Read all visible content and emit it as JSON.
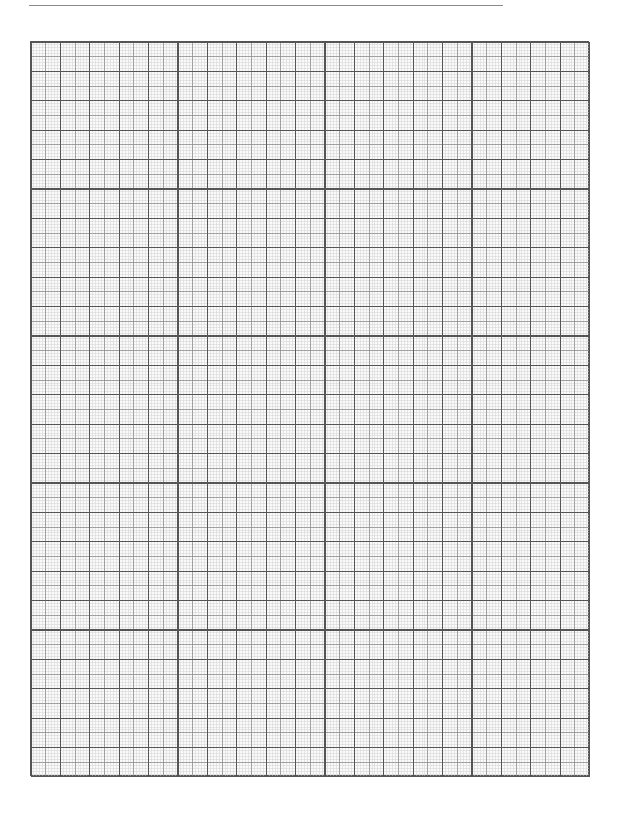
{
  "document": {
    "type": "graph-paper",
    "header_rule": {
      "x_start": 29,
      "x_end": 503,
      "y": 5,
      "color": "#8a8a8a"
    },
    "grid": {
      "left": 30,
      "top": 41,
      "columns": 19,
      "rows": 25,
      "major_spacing_px": 29.4,
      "subdivisions": 10,
      "colors": {
        "major": "#555555",
        "medium": "#8c8c8c",
        "minor": "#d2d2d2",
        "background": "#fafafa"
      }
    }
  }
}
